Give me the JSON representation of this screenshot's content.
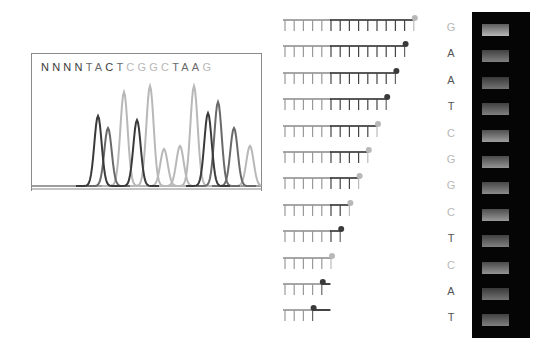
{
  "colors": {
    "dark": "#3a3a3a",
    "mid": "#6a6a6a",
    "light": "#b8b8b8",
    "gel_bg": "#050505"
  },
  "chromatogram": {
    "sequence": [
      {
        "base": "N",
        "shade": "dark"
      },
      {
        "base": "N",
        "shade": "dark"
      },
      {
        "base": "N",
        "shade": "dark"
      },
      {
        "base": "N",
        "shade": "dark"
      },
      {
        "base": "T",
        "shade": "mid"
      },
      {
        "base": "A",
        "shade": "mid"
      },
      {
        "base": "C",
        "shade": "dark"
      },
      {
        "base": "T",
        "shade": "mid"
      },
      {
        "base": "C",
        "shade": "light"
      },
      {
        "base": "G",
        "shade": "light"
      },
      {
        "base": "G",
        "shade": "light"
      },
      {
        "base": "C",
        "shade": "light"
      },
      {
        "base": "T",
        "shade": "mid"
      },
      {
        "base": "A",
        "shade": "mid"
      },
      {
        "base": "A",
        "shade": "mid"
      },
      {
        "base": "G",
        "shade": "light"
      }
    ],
    "peaks": [
      {
        "x": 66,
        "h": 70,
        "shade": "dark"
      },
      {
        "x": 76,
        "h": 58,
        "shade": "mid"
      },
      {
        "x": 92,
        "h": 94,
        "shade": "light"
      },
      {
        "x": 105,
        "h": 66,
        "shade": "dark"
      },
      {
        "x": 118,
        "h": 100,
        "shade": "light"
      },
      {
        "x": 132,
        "h": 37,
        "shade": "light"
      },
      {
        "x": 148,
        "h": 40,
        "shade": "light"
      },
      {
        "x": 162,
        "h": 100,
        "shade": "light"
      },
      {
        "x": 176,
        "h": 73,
        "shade": "dark"
      },
      {
        "x": 186,
        "h": 84,
        "shade": "mid"
      },
      {
        "x": 202,
        "h": 58,
        "shade": "mid"
      },
      {
        "x": 218,
        "h": 40,
        "shade": "light"
      }
    ]
  },
  "fragments": [
    {
      "base": "G",
      "length": 15,
      "shade": "light"
    },
    {
      "base": "A",
      "length": 14,
      "shade": "dark"
    },
    {
      "base": "A",
      "length": 13,
      "shade": "dark"
    },
    {
      "base": "T",
      "length": 12,
      "shade": "dark"
    },
    {
      "base": "C",
      "length": 11,
      "shade": "light"
    },
    {
      "base": "G",
      "length": 10,
      "shade": "light"
    },
    {
      "base": "G",
      "length": 9,
      "shade": "light"
    },
    {
      "base": "C",
      "length": 8,
      "shade": "light"
    },
    {
      "base": "T",
      "length": 7,
      "shade": "dark"
    },
    {
      "base": "C",
      "length": 6,
      "shade": "light"
    },
    {
      "base": "A",
      "length": 5,
      "shade": "dark"
    },
    {
      "base": "T",
      "length": 4,
      "shade": "dark"
    }
  ],
  "gel": {
    "lanes": 1,
    "bands": [
      0.72,
      0.5,
      0.45,
      0.5,
      0.62,
      0.58,
      0.55,
      0.6,
      0.5,
      0.58,
      0.45,
      0.5
    ]
  }
}
